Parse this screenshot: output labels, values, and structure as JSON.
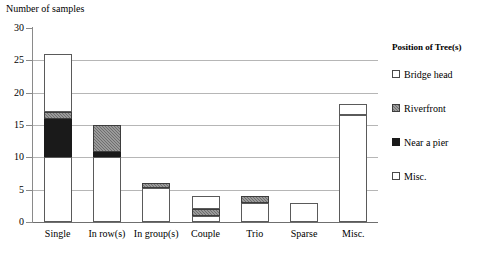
{
  "chart_data": {
    "type": "bar",
    "subtype": "stacked-bar",
    "title": "",
    "ylabel": "Number of samples",
    "xlabel": "",
    "ylim": [
      0,
      30
    ],
    "yticks": [
      0,
      5,
      10,
      15,
      20,
      25,
      30
    ],
    "grid": true,
    "legend_position": "right",
    "legend_title": "Position of Tree(s)",
    "categories": [
      "Single",
      "In row(s)",
      "In group(s)",
      "Couple",
      "Trio",
      "Sparse",
      "Misc."
    ],
    "series": [
      {
        "name": "Bridge head",
        "swatch": "white",
        "values": [
          10,
          10,
          5.2,
          1,
          3,
          3,
          16.5
        ]
      },
      {
        "name": "Near a pier",
        "swatch": "black",
        "values": [
          6,
          0.8,
          0,
          0,
          0,
          0,
          0
        ]
      },
      {
        "name": "Riverfront",
        "swatch": "gray",
        "values": [
          1,
          4.2,
          0.8,
          1,
          1,
          0,
          0
        ]
      },
      {
        "name": "Misc.",
        "swatch": "white",
        "values": [
          9,
          0,
          0,
          2,
          0,
          0,
          1.8
        ]
      }
    ],
    "totals": [
      26,
      15,
      6,
      4,
      4,
      3,
      18.3
    ]
  },
  "legend": {
    "title": "Position of Tree(s)",
    "items": [
      {
        "label": "Bridge head",
        "swatch": "white"
      },
      {
        "label": "Riverfront",
        "swatch": "gray"
      },
      {
        "label": "Near a pier",
        "swatch": "black"
      },
      {
        "label": "Misc.",
        "swatch": "white"
      }
    ]
  }
}
